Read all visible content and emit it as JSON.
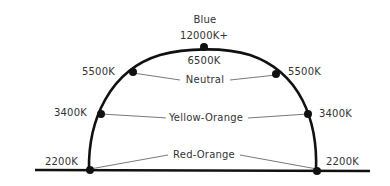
{
  "diagram": {
    "top": {
      "color_label": "Blue",
      "kelvin_label": "12000K+"
    },
    "peak_label": "6500K",
    "bands": [
      {
        "name": "Neutral",
        "left_kelvin": "5500K",
        "right_kelvin": "5500K"
      },
      {
        "name": "Yellow-Orange",
        "left_kelvin": "3400K",
        "right_kelvin": "3400K"
      },
      {
        "name": "Red-Orange",
        "left_kelvin": "2200K",
        "right_kelvin": "2200K"
      }
    ],
    "colors": {
      "line": "#111111",
      "connector": "#555555",
      "text": "#333333",
      "background": "#ffffff"
    }
  }
}
